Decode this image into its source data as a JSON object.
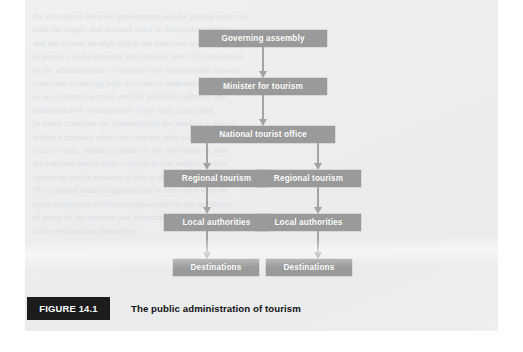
{
  "figure": {
    "badge_label": "FIGURE 14.1",
    "caption": "The public administration of tourism",
    "badge_color": "#1c1c1c",
    "node_color": "#9a9a9a",
    "node_text_color": "#ffffff",
    "arrow_color": "#a3a3a3",
    "page_color": "#ecedef"
  },
  "chart_data": {
    "type": "diagram",
    "title": "The public administration of tourism",
    "orientation": "top-down",
    "nodes": [
      {
        "id": "governing-assembly",
        "label": "Governing assembly",
        "level": 0,
        "column": "center"
      },
      {
        "id": "minister-tourism",
        "label": "Minister for tourism",
        "level": 1,
        "column": "center"
      },
      {
        "id": "national-office",
        "label": "National tourist office",
        "level": 2,
        "column": "center"
      },
      {
        "id": "regional-tourism-1",
        "label": "Regional tourism",
        "level": 3,
        "column": "left"
      },
      {
        "id": "regional-tourism-2",
        "label": "Regional tourism",
        "level": 3,
        "column": "right"
      },
      {
        "id": "local-authorities-1",
        "label": "Local authorities",
        "level": 4,
        "column": "left"
      },
      {
        "id": "local-authorities-2",
        "label": "Local authorities",
        "level": 4,
        "column": "right"
      },
      {
        "id": "destinations-1",
        "label": "Destinations",
        "level": 5,
        "column": "left"
      },
      {
        "id": "destinations-2",
        "label": "Destinations",
        "level": 5,
        "column": "right"
      }
    ],
    "edges": [
      {
        "from": "governing-assembly",
        "to": "minister-tourism",
        "style": "arrow"
      },
      {
        "from": "minister-tourism",
        "to": "national-office",
        "style": "arrow"
      },
      {
        "from": "national-office",
        "to": "regional-tourism-1",
        "style": "arrow"
      },
      {
        "from": "national-office",
        "to": "regional-tourism-2",
        "style": "arrow"
      },
      {
        "from": "regional-tourism-1",
        "to": "local-authorities-1",
        "style": "arrow"
      },
      {
        "from": "regional-tourism-2",
        "to": "local-authorities-2",
        "style": "arrow"
      },
      {
        "from": "local-authorities-1",
        "to": "destinations-1",
        "style": "arrow"
      },
      {
        "from": "local-authorities-2",
        "to": "destinations-2",
        "style": "arrow"
      }
    ]
  },
  "ghost_text": {
    "lines": [
      "the interaction between government and the private sector in",
      "both the supply and demand sides of the tourism market,",
      "and the system through which the functions are carried out",
      "in practice at the national and regional level. The structures",
      "of the administration of tourism vary considerably between",
      "countries, reflecting both the relative importance of tourism",
      "as an economic activity and the political traditions and",
      "administrative arrangements of the state concerned.",
      "",
      "In many countries the responsibility for tourism is placed",
      "within a ministry which also carries other responsibilities,",
      "such as trade, industry, culture or the environment, and",
      "the national tourist office reports to that ministry while",
      "operating with a measure of day to day independence.",
      "The regional tourist organisations in turn work with the",
      "local authorities which are responsible for the provision",
      "of many of the services and amenities used by visitors",
      "at the destinations themselves."
    ]
  }
}
